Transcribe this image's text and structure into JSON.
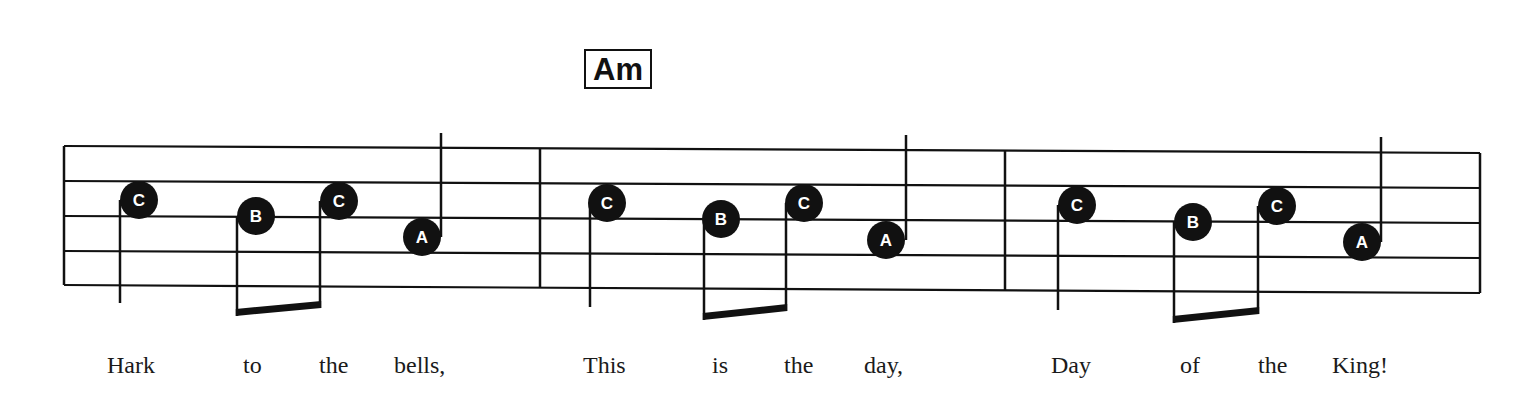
{
  "chord": {
    "label": "Am"
  },
  "colors": {
    "ink": "#111111",
    "paper": "#ffffff",
    "note_label": "#ffffff"
  },
  "staff": {
    "lines": 5,
    "left_x": 64,
    "right_x": 1480,
    "left_y": [
      146,
      181,
      216,
      251,
      285
    ],
    "right_y": [
      153,
      188,
      223,
      258,
      293
    ],
    "barlines_x": [
      540,
      1005
    ]
  },
  "measures": [
    {
      "notes": [
        {
          "label": "C",
          "cx": 139,
          "cy": 200,
          "stem": "down",
          "stem_x": 120,
          "stem_end": 303
        },
        {
          "label": "B",
          "cx": 256,
          "cy": 216,
          "stem": "down",
          "stem_x": 237,
          "stem_end": 316,
          "beam_group": 1
        },
        {
          "label": "C",
          "cx": 339,
          "cy": 201,
          "stem": "down",
          "stem_x": 320,
          "stem_end": 308,
          "beam_group": 1
        },
        {
          "label": "A",
          "cx": 422,
          "cy": 237,
          "stem": "up",
          "stem_x": 441,
          "stem_end": 133
        }
      ],
      "lyrics": [
        {
          "text": "Hark",
          "x": 107
        },
        {
          "text": "to",
          "x": 243
        },
        {
          "text": "the",
          "x": 319
        },
        {
          "text": "bells,",
          "x": 394
        }
      ]
    },
    {
      "notes": [
        {
          "label": "C",
          "cx": 607,
          "cy": 203,
          "stem": "down",
          "stem_x": 590,
          "stem_end": 307
        },
        {
          "label": "B",
          "cx": 721,
          "cy": 219,
          "stem": "down",
          "stem_x": 704,
          "stem_end": 320,
          "beam_group": 1
        },
        {
          "label": "C",
          "cx": 804,
          "cy": 203,
          "stem": "down",
          "stem_x": 786,
          "stem_end": 311,
          "beam_group": 1
        },
        {
          "label": "A",
          "cx": 886,
          "cy": 240,
          "stem": "up",
          "stem_x": 906,
          "stem_end": 135
        }
      ],
      "lyrics": [
        {
          "text": "This",
          "x": 583
        },
        {
          "text": "is",
          "x": 712
        },
        {
          "text": "the",
          "x": 784
        },
        {
          "text": "day,",
          "x": 864
        }
      ]
    },
    {
      "notes": [
        {
          "label": "C",
          "cx": 1077,
          "cy": 205,
          "stem": "down",
          "stem_x": 1058,
          "stem_end": 310
        },
        {
          "label": "B",
          "cx": 1193,
          "cy": 222,
          "stem": "down",
          "stem_x": 1174,
          "stem_end": 323,
          "beam_group": 1
        },
        {
          "label": "C",
          "cx": 1277,
          "cy": 206,
          "stem": "down",
          "stem_x": 1258,
          "stem_end": 314,
          "beam_group": 1
        },
        {
          "label": "A",
          "cx": 1362,
          "cy": 242,
          "stem": "up",
          "stem_x": 1381,
          "stem_end": 137
        }
      ],
      "lyrics": [
        {
          "text": "Day",
          "x": 1051
        },
        {
          "text": "of",
          "x": 1180
        },
        {
          "text": "the",
          "x": 1258
        },
        {
          "text": "King!",
          "x": 1332
        }
      ]
    }
  ]
}
